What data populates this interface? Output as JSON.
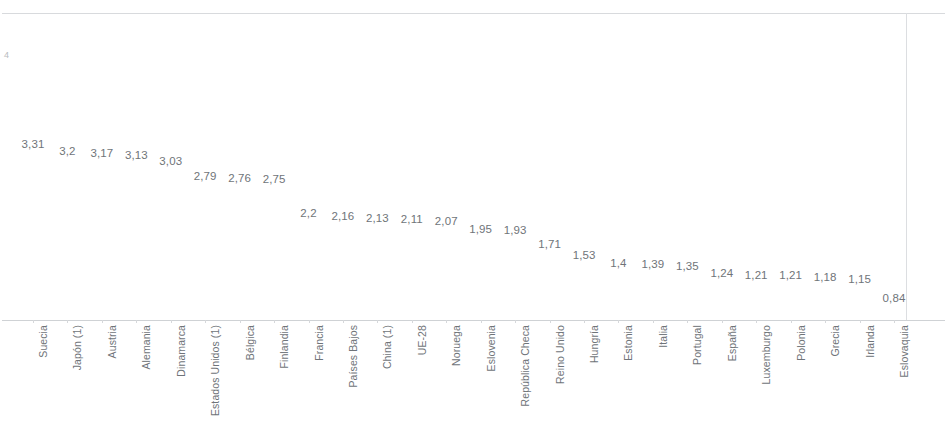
{
  "chart_data": {
    "type": "scatter",
    "title": "",
    "subtitle": "",
    "xlabel": "",
    "ylabel": "",
    "ylim": [
      0,
      4
    ],
    "grid": false,
    "legend": null,
    "axis_ticks_y": [
      "4"
    ],
    "categories": [
      "Suecia",
      "Japón (1)",
      "Austria",
      "Alemania",
      "Dinamarca",
      "Estados Unidos (1)",
      "Bélgica",
      "Finlandia",
      "Francia",
      "Países Bajos",
      "China (1)",
      "UE-28",
      "Noruega",
      "Eslovenia",
      "República Checa",
      "Reino Unido",
      "Hungría",
      "Estonia",
      "Italia",
      "Portugal",
      "España",
      "Luxemburgo",
      "Polonia",
      "Grecia",
      "Irlanda",
      "Eslovaquia"
    ],
    "values": [
      3.31,
      3.2,
      3.17,
      3.13,
      3.03,
      2.79,
      2.76,
      2.75,
      2.2,
      2.16,
      2.13,
      2.11,
      2.07,
      1.95,
      1.93,
      1.71,
      1.53,
      1.4,
      1.39,
      1.35,
      1.24,
      1.21,
      1.21,
      1.18,
      1.15,
      0.84
    ],
    "value_labels": [
      "3,31",
      "3,2",
      "3,17",
      "3,13",
      "3,03",
      "2,79",
      "2,76",
      "2,75",
      "2,2",
      "2,16",
      "2,13",
      "2,11",
      "2,07",
      "1,95",
      "1,93",
      "1,71",
      "1,53",
      "1,4",
      "1,39",
      "1,35",
      "1,24",
      "1,21",
      "1,21",
      "1,18",
      "1,15",
      "0,84"
    ]
  },
  "colors": {
    "label_text": "#6f7479",
    "frame": "#d8dadd",
    "background": "#ffffff"
  }
}
